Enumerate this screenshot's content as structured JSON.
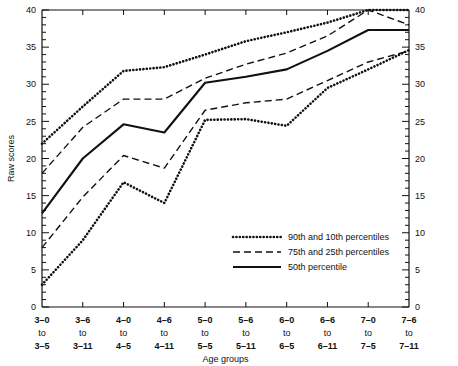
{
  "chart_data": {
    "type": "line",
    "title": "",
    "xlabel": "Age groups",
    "ylabel": "Raw scores",
    "ylim": [
      0,
      40
    ],
    "ytick_step": 5,
    "yminor_step": 1,
    "grid": false,
    "legend_position": "inside-lower-right",
    "ytick_labels": [
      "0",
      "5",
      "10",
      "15",
      "20",
      "25",
      "30",
      "35",
      "40"
    ],
    "categories": [
      {
        "top": "3–0",
        "mid": "to",
        "bot": "3–5"
      },
      {
        "top": "3–6",
        "mid": "to",
        "bot": "3–11"
      },
      {
        "top": "4–0",
        "mid": "to",
        "bot": "4–5"
      },
      {
        "top": "4–6",
        "mid": "to",
        "bot": "4–11"
      },
      {
        "top": "5–0",
        "mid": "to",
        "bot": "5–5"
      },
      {
        "top": "5–6",
        "mid": "to",
        "bot": "5–11"
      },
      {
        "top": "6–0",
        "mid": "to",
        "bot": "6–5"
      },
      {
        "top": "6–6",
        "mid": "to",
        "bot": "6–11"
      },
      {
        "top": "7–0",
        "mid": "to",
        "bot": "7–5"
      },
      {
        "top": "7–6",
        "mid": "to",
        "bot": "7–11"
      }
    ],
    "series": [
      {
        "name": "90th percentile",
        "style": "dotted",
        "values": [
          22.0,
          27.0,
          31.8,
          32.3,
          34.0,
          35.8,
          37.0,
          38.3,
          40.0,
          40.0
        ]
      },
      {
        "name": "75th percentile",
        "style": "dashed",
        "values": [
          18.0,
          24.2,
          28.0,
          28.0,
          30.8,
          32.7,
          34.2,
          36.5,
          40.0,
          38.0
        ]
      },
      {
        "name": "50th percentile",
        "style": "solid",
        "values": [
          12.6,
          20.0,
          24.6,
          23.5,
          30.2,
          31.0,
          32.0,
          34.5,
          37.3,
          37.3
        ]
      },
      {
        "name": "25th percentile",
        "style": "dashed",
        "values": [
          8.0,
          14.8,
          20.4,
          18.7,
          26.5,
          27.5,
          28.0,
          30.5,
          33.0,
          34.5
        ]
      },
      {
        "name": "10th percentile",
        "style": "dotted",
        "values": [
          3.0,
          9.0,
          16.8,
          14.0,
          25.2,
          25.3,
          24.4,
          29.5,
          32.0,
          34.6
        ]
      }
    ]
  },
  "legend": {
    "items": [
      {
        "label": "90th and 10th percentiles",
        "style": "dotted"
      },
      {
        "label": "75th and 25th percentiles",
        "style": "dashed"
      },
      {
        "label": "50th percentile",
        "style": "solid"
      }
    ]
  },
  "axes": {
    "y_left_label": "Raw scores",
    "x_label": "Age groups"
  }
}
